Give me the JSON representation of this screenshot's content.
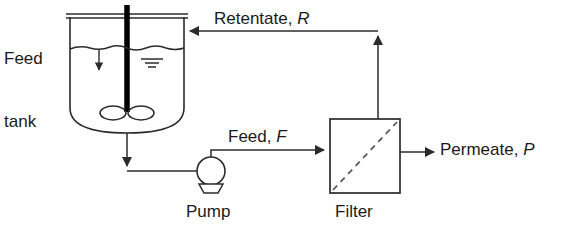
{
  "diagram": {
    "stroke_color": "#2b2b2b",
    "shaft_color": "#000000",
    "background": "#ffffff"
  },
  "labels": {
    "feed_tank_line1": "Feed",
    "feed_tank_line2": "tank",
    "retentate_text": "Retentate,",
    "retentate_symbol": "R",
    "feed_text": "Feed,",
    "feed_symbol": "F",
    "permeate_text": "Permeate,",
    "permeate_symbol": "P",
    "pump": "Pump",
    "filter": "Filter"
  },
  "equipment": {
    "tank": {
      "name": "feed-tank",
      "has_lid": true,
      "has_agitator": true,
      "has_impeller": true,
      "liquid_surface": "wavy",
      "level_indicator": "three-stacked-lines"
    },
    "pump": {
      "name": "centrifugal-pump",
      "symbol": "circle-with-arrow-on-base"
    },
    "filter": {
      "name": "membrane-filter",
      "symbol": "square-with-dashed-diagonal-membrane"
    }
  },
  "streams": [
    {
      "id": "feed",
      "label": "Feed, F",
      "from": "pump",
      "to": "filter",
      "direction": "right"
    },
    {
      "id": "retentate",
      "label": "Retentate, R",
      "from": "filter",
      "to": "feed-tank",
      "direction": "up-then-left"
    },
    {
      "id": "permeate",
      "label": "Permeate, P",
      "from": "filter",
      "to": "outlet",
      "direction": "right"
    },
    {
      "id": "tank-outlet",
      "label": "",
      "from": "feed-tank",
      "to": "pump",
      "direction": "down-then-right"
    }
  ]
}
